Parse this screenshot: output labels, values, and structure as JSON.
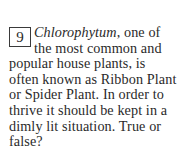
{
  "question": {
    "number": "9",
    "term": "Chlorophytum",
    "text": ", one of the most common and popular house plants, is often known as Ribbon Plant or Spider Plant. In order to thrive it should be kept in a dimly lit situation. True or false?"
  }
}
